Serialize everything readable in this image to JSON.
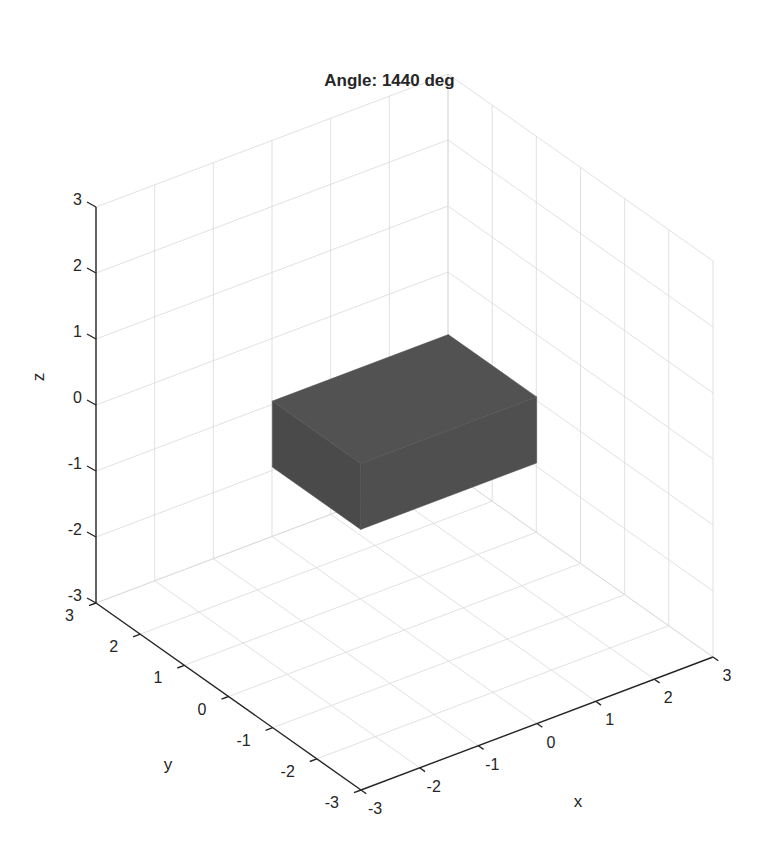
{
  "figure": {
    "title": "Angle: 1440 deg"
  },
  "chart_data": {
    "type": "3d-surface",
    "title": "Angle: 1440 deg",
    "xlabel": "x",
    "ylabel": "y",
    "zlabel": "z",
    "xlim": [
      -3,
      3
    ],
    "ylim": [
      -3,
      3
    ],
    "zlim": [
      -3,
      3
    ],
    "xticks": [
      "-3",
      "-2",
      "-1",
      "0",
      "1",
      "2",
      "3"
    ],
    "yticks": [
      "-3",
      "-2",
      "-1",
      "0",
      "1",
      "2",
      "3"
    ],
    "zticks": [
      "-3",
      "-2",
      "-1",
      "0",
      "1",
      "2",
      "3"
    ],
    "grid": true,
    "view": "default 3D view (azimuth -37.5, elevation 30)",
    "objects": [
      {
        "kind": "rectangular box",
        "color": "#4d4d4d",
        "approx_extent": {
          "x": [
            -1.5,
            1.5
          ],
          "y": [
            -1,
            1
          ],
          "z": [
            -0.5,
            0.5
          ]
        }
      }
    ]
  },
  "colors": {
    "axis": "#262626",
    "grid": "#d9d9d9",
    "box_front": "#4f4f4f",
    "box_side": "#4a4a4a",
    "box_top": "#525252"
  }
}
